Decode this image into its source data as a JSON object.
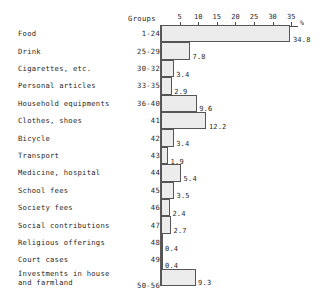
{
  "chart_data": {
    "type": "bar",
    "orientation": "horizontal",
    "title": "",
    "xlabel": "%",
    "ylabel": "",
    "xlim": [
      0,
      36.5
    ],
    "grid": false,
    "legend": null,
    "axis_ticks": [
      5,
      10,
      15,
      20,
      25,
      30,
      35
    ],
    "axis_unit": "%",
    "group_column_header": "Groups",
    "categories": [
      "Food",
      "Drink",
      "Cigarettes, etc.",
      "Personal articles",
      "Household equipments",
      "Clothes, shoes",
      "Bicycle",
      "Transport",
      "Medicine, hospital",
      "School fees",
      "Society fees",
      "Social contributions",
      "Religious offerings",
      "Court cases",
      "Investments in house and farmland"
    ],
    "groups": [
      "1-24",
      "25-29",
      "30-32",
      "33-35",
      "36-40",
      "41",
      "42",
      "43",
      "44",
      "45",
      "46",
      "47",
      "48",
      "49",
      "50-56"
    ],
    "values": [
      34.8,
      7.8,
      3.4,
      2.9,
      9.6,
      12.2,
      3.4,
      1.9,
      5.4,
      3.5,
      2.4,
      2.7,
      0.4,
      0.4,
      9.3
    ],
    "value_labels": [
      "34.8",
      "7.8",
      "3.4",
      "2.9",
      "9.6",
      "12.2",
      "3.4",
      "1.9",
      "5.4",
      "3.5",
      "2.4",
      "2.7",
      "0.4",
      "0.4",
      "9.3"
    ]
  },
  "rows": [
    {
      "label": "Food",
      "label2": "",
      "group": "1-24",
      "value": 34.8,
      "value_label": "34.8"
    },
    {
      "label": "Drink",
      "label2": "",
      "group": "25-29",
      "value": 7.8,
      "value_label": "7.8"
    },
    {
      "label": "Cigarettes, etc.",
      "label2": "",
      "group": "30-32",
      "value": 3.4,
      "value_label": "3.4"
    },
    {
      "label": "Personal articles",
      "label2": "",
      "group": "33-35",
      "value": 2.9,
      "value_label": "2.9"
    },
    {
      "label": "Household equipments",
      "label2": "",
      "group": "36-40",
      "value": 9.6,
      "value_label": "9.6"
    },
    {
      "label": "Clothes, shoes",
      "label2": "",
      "group": "41",
      "value": 12.2,
      "value_label": "12.2"
    },
    {
      "label": "Bicycle",
      "label2": "",
      "group": "42",
      "value": 3.4,
      "value_label": "3.4"
    },
    {
      "label": "Transport",
      "label2": "",
      "group": "43",
      "value": 1.9,
      "value_label": "1.9"
    },
    {
      "label": "Medicine, hospital",
      "label2": "",
      "group": "44",
      "value": 5.4,
      "value_label": "5.4"
    },
    {
      "label": "School fees",
      "label2": "",
      "group": "45",
      "value": 3.5,
      "value_label": "3.5"
    },
    {
      "label": "Society fees",
      "label2": "",
      "group": "46",
      "value": 2.4,
      "value_label": "2.4"
    },
    {
      "label": "Social contributions",
      "label2": "",
      "group": "47",
      "value": 2.7,
      "value_label": "2.7"
    },
    {
      "label": "Religious offerings",
      "label2": "",
      "group": "48",
      "value": 0.4,
      "value_label": "0.4"
    },
    {
      "label": "Court cases",
      "label2": "",
      "group": "49",
      "value": 0.4,
      "value_label": "0.4"
    },
    {
      "label": "Investments in house",
      "label2": "and farmland",
      "group": "50-56",
      "value": 9.3,
      "value_label": "9.3"
    }
  ],
  "style": {
    "bar_fill": "#ececec",
    "bar_border": "#555555",
    "axis_color": "#4a4a4a",
    "text_color": "#1f1f1f"
  }
}
